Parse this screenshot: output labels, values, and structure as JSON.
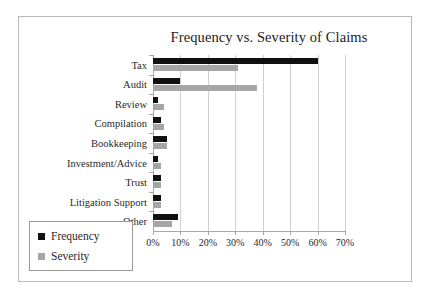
{
  "chart_data": {
    "type": "bar",
    "orientation": "horizontal",
    "title": "Frequency vs. Severity of Claims",
    "xlabel": "",
    "ylabel": "",
    "xlim": [
      0,
      70
    ],
    "xtick_labels": [
      "0%",
      "10%",
      "20%",
      "30%",
      "40%",
      "50%",
      "60%",
      "70%"
    ],
    "xtick_values": [
      0,
      10,
      20,
      30,
      40,
      50,
      60,
      70
    ],
    "grid": true,
    "legend_position": "bottom-left",
    "categories": [
      "Tax",
      "Audit",
      "Review",
      "Compilation",
      "Bookkeeping",
      "Investment/Advice",
      "Trust",
      "Litigation Support",
      "Other"
    ],
    "series": [
      {
        "name": "Frequency",
        "color": "#111111",
        "values": [
          60,
          10,
          2,
          3,
          5,
          2,
          3,
          3,
          9
        ]
      },
      {
        "name": "Severity",
        "color": "#a6a6a6",
        "values": [
          31,
          38,
          4,
          4,
          5,
          3,
          3,
          3,
          7
        ]
      }
    ]
  },
  "legend": {
    "items": [
      {
        "label": "Frequency",
        "color": "#111111"
      },
      {
        "label": "Severity",
        "color": "#a6a6a6"
      }
    ]
  },
  "colors": {
    "frequency": "#111111",
    "severity": "#a6a6a6",
    "gridline": "#cfcfcf",
    "axis": "#a8a8a8",
    "frame_border": "#b9b9b9",
    "text": "#2a2a2a",
    "background": "#ffffff"
  }
}
